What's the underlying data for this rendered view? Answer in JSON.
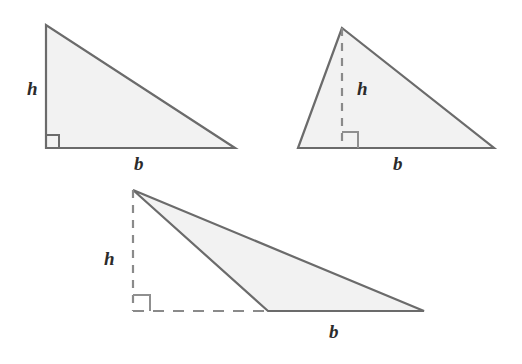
{
  "figure": {
    "colors": {
      "background": "#ffffff",
      "fill": "#f2f2f2",
      "stroke": "#6b6b6b",
      "dashed_stroke": "#8a8a8a",
      "label": "#2b2b2b"
    },
    "triangles": [
      {
        "id": "right-triangle",
        "name": "right triangle",
        "height_label": "h",
        "base_label": "b",
        "height_style": "solid",
        "base_style": "solid",
        "vertices": "46,25 46,148 235,148",
        "right_angle_marker": "59,148 59,135 46,135",
        "height_label_pos": {
          "x": 27,
          "y": 95
        },
        "base_label_pos": {
          "x": 134,
          "y": 170
        }
      },
      {
        "id": "acute-triangle",
        "name": "acute triangle with interior height",
        "height_label": "h",
        "base_label": "b",
        "height_style": "dashed",
        "base_style": "solid",
        "vertices": "342,28 298,148 494,148",
        "height_segment": "342,28 342,148",
        "right_angle_marker": "342,132 358,132 358,148",
        "height_label_pos": {
          "x": 357,
          "y": 95
        },
        "base_label_pos": {
          "x": 393,
          "y": 170
        }
      },
      {
        "id": "obtuse-triangle",
        "name": "obtuse triangle with exterior height",
        "height_label": "h",
        "base_label": "b",
        "height_style": "dashed",
        "base_style": "dashed-extension",
        "vertices": "133,190 268,311 424,311",
        "height_segment": "133,190 133,311",
        "base_extension_segment": "133,311 268,311",
        "right_angle_marker": "133,295 150,295 150,311",
        "height_label_pos": {
          "x": 104,
          "y": 265
        },
        "base_label_pos": {
          "x": 329,
          "y": 338
        }
      }
    ]
  }
}
